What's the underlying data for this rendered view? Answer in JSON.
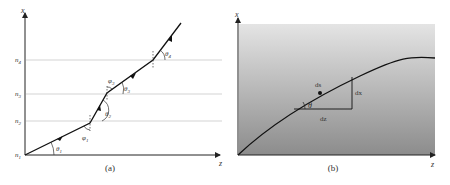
{
  "panel_a": {
    "caption": "(a)",
    "axis_x_label": "x",
    "axis_z_label": "z",
    "layers": [
      {
        "label": "n",
        "sub": "1"
      },
      {
        "label": "n",
        "sub": "2"
      },
      {
        "label": "n",
        "sub": "3"
      },
      {
        "label": "n",
        "sub": "4"
      }
    ],
    "angles": [
      {
        "sym": "θ",
        "sub": "1"
      },
      {
        "sym": "φ",
        "sub": "1"
      },
      {
        "sym": "θ",
        "sub": "2"
      },
      {
        "sym": "φ",
        "sub": "3"
      },
      {
        "sym": "θ",
        "sub": "3"
      },
      {
        "sym": "θ",
        "sub": "4"
      }
    ]
  },
  "panel_b": {
    "caption": "(b)",
    "axis_x_label": "x",
    "axis_z_label": "z",
    "ds_label": "ds",
    "dx_label": "dx",
    "dz_label": "dz",
    "theta_label": "θ",
    "gradient_top": "#e4e4e4",
    "gradient_bottom": "#8c8c8c"
  }
}
